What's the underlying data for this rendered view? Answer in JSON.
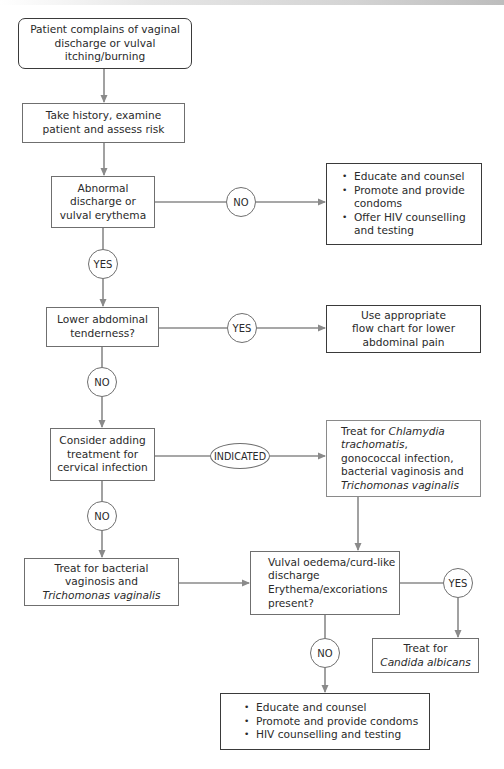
{
  "colors": {
    "line": "#8a8a8a",
    "border_dark": "#3a3a3a",
    "border": "#6f6f6f",
    "text": "#2a2a2a"
  },
  "boxes": {
    "start": {
      "lines": [
        "Patient complains of vaginal",
        "discharge or vulval",
        "itching/burning"
      ]
    },
    "history": {
      "lines": [
        "Take history, examine",
        "patient and assess risk"
      ]
    },
    "abnormal": {
      "lines": [
        "Abnormal",
        "discharge or",
        "vulval erythema"
      ]
    },
    "educate_top": {
      "items": [
        "Educate and counsel",
        "Promote and  provide condoms",
        "Offer HIV counselling and testing"
      ]
    },
    "lower_abdominal": {
      "lines": [
        "Lower abdominal",
        "tenderness?"
      ]
    },
    "use_flowchart": {
      "lines": [
        "Use appropriate",
        "flow chart for lower",
        "abdominal pain"
      ]
    },
    "consider": {
      "lines": [
        "Consider adding",
        "treatment for",
        "cervical infection"
      ]
    },
    "treat_chlamydia": {
      "line1_prefix": "Treat for ",
      "line1_italic": "Chlamydia",
      "line2_italic": "trachomatis",
      "line2_suffix": ",",
      "line3": "gonococcal infection,",
      "line4": "bacterial vaginosis and",
      "line5_italic": "Trichomonas vaginalis"
    },
    "treat_bv": {
      "line1": "Treat for bacterial",
      "line2": "vaginosis and",
      "line3_italic": "Trichomonas vaginalis"
    },
    "vulval": {
      "lines": [
        "Vulval oedema/curd-like",
        "discharge",
        "Erythema/excoriations",
        "present?"
      ]
    },
    "treat_candida": {
      "line1": "Treat for",
      "line2_italic": "Candida albicans"
    },
    "educate_bottom": {
      "items": [
        "Educate and counsel",
        "Promote and provide condoms",
        "HIV counselling and testing"
      ]
    }
  },
  "decisions": {
    "abnormal_no": "NO",
    "abnormal_yes": "YES",
    "lower_yes": "YES",
    "lower_no": "NO",
    "consider_indicated": "INDICATED",
    "consider_no": "NO",
    "vulval_yes": "YES",
    "vulval_no": "NO"
  }
}
